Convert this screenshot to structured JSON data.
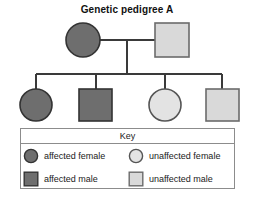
{
  "title": "Genetic pedigree A",
  "colors": {
    "affected_fill": "#6e6e6e",
    "unaffected_fill": "#d9d9d9",
    "unaffected_circle_fill": "#e3e3e3",
    "symbol_stroke": "#333333",
    "line": "#3a3a3a",
    "key_border": "#8c8c8c",
    "background": "#ffffff"
  },
  "pedigree": {
    "generations": [
      {
        "name": "parents",
        "individuals": [
          {
            "id": "mother",
            "sex": "female",
            "shape": "circle",
            "status": "affected",
            "label": "affected female"
          },
          {
            "id": "father",
            "sex": "male",
            "shape": "square",
            "status": "unaffected",
            "label": "unaffected male"
          }
        ]
      },
      {
        "name": "children",
        "individuals": [
          {
            "id": "child-1",
            "sex": "female",
            "shape": "circle",
            "status": "affected",
            "label": "affected female"
          },
          {
            "id": "child-2",
            "sex": "male",
            "shape": "square",
            "status": "affected",
            "label": "affected male"
          },
          {
            "id": "child-3",
            "sex": "female",
            "shape": "circle",
            "status": "unaffected",
            "label": "unaffected female"
          },
          {
            "id": "child-4",
            "sex": "male",
            "shape": "square",
            "status": "unaffected",
            "label": "unaffected male"
          }
        ]
      }
    ]
  },
  "key": {
    "title": "Key",
    "entries": [
      {
        "shape": "circle",
        "status": "affected",
        "label": "affected female"
      },
      {
        "shape": "circle",
        "status": "unaffected",
        "label": "unaffected female"
      },
      {
        "shape": "square",
        "status": "affected",
        "label": "affected male"
      },
      {
        "shape": "square",
        "status": "unaffected",
        "label": "unaffected male"
      }
    ]
  }
}
